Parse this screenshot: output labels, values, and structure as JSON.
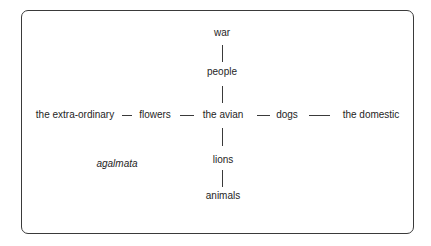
{
  "diagram": {
    "nodes": {
      "war": "war",
      "people": "people",
      "extraordinary": "the extra-ordinary",
      "flowers": "flowers",
      "avian": "the avian",
      "dogs": "dogs",
      "domestic": "the domestic",
      "agalmata": "agalmata",
      "lions": "lions",
      "animals": "animals"
    },
    "edges": [
      [
        "war",
        "people"
      ],
      [
        "people",
        "the avian"
      ],
      [
        "the extra-ordinary",
        "flowers"
      ],
      [
        "flowers",
        "the avian"
      ],
      [
        "the avian",
        "dogs"
      ],
      [
        "dogs",
        "the domestic"
      ],
      [
        "the avian",
        "lions"
      ],
      [
        "lions",
        "animals"
      ]
    ]
  }
}
